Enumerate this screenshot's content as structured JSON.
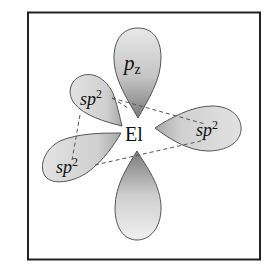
{
  "diagram": {
    "center_atom": "El",
    "orbitals": [
      {
        "id": "pz-top",
        "label_main": "p",
        "label_sub": "z",
        "direction": "up"
      },
      {
        "id": "pz-bottom",
        "label_main": "",
        "label_sub": "",
        "direction": "down"
      },
      {
        "id": "sp2-upper-left",
        "label_main": "sp",
        "label_sup": "2",
        "direction": "upper-left"
      },
      {
        "id": "sp2-lower-left",
        "label_main": "sp",
        "label_sup": "2",
        "direction": "lower-left"
      },
      {
        "id": "sp2-right",
        "label_main": "sp",
        "label_sup": "2",
        "direction": "right"
      }
    ],
    "colors": {
      "frame": "#222222",
      "lobe_fill_light": "#e6e6e6",
      "lobe_fill_dark": "#8c8c8c",
      "lobe_stroke": "#555555",
      "dash": "#555555"
    }
  }
}
